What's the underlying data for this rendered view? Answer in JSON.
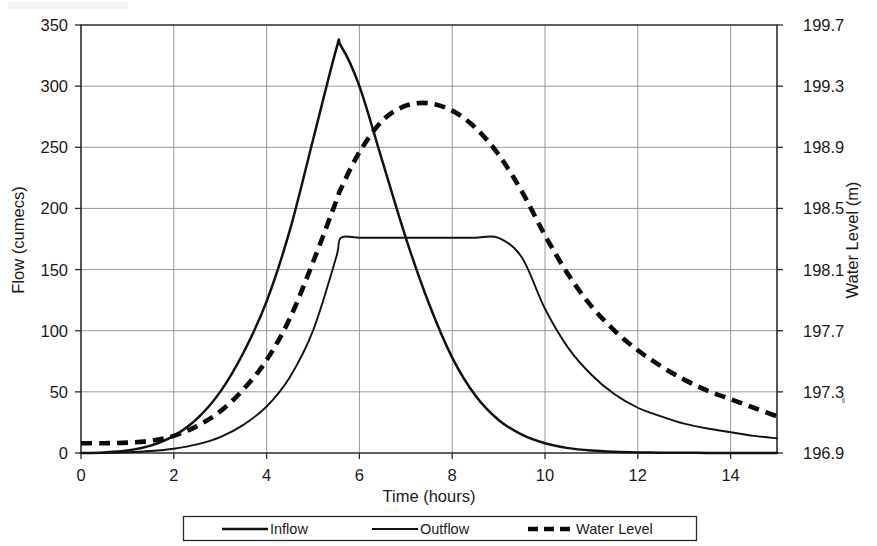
{
  "chart_data": {
    "type": "line",
    "title": "",
    "xlabel": "Time (hours)",
    "ylabel": "Flow (cumecs)",
    "y2label": "Water Level (m)",
    "xlim": [
      0,
      15
    ],
    "ylim": [
      0,
      350
    ],
    "y2lim": [
      196.9,
      199.7
    ],
    "grid": true,
    "legend_position": "bottom",
    "x_ticks": [
      0,
      2,
      4,
      6,
      8,
      10,
      12,
      14
    ],
    "x_tick_labels": [
      "0",
      "2",
      "4",
      "6",
      "8",
      "10",
      "12",
      "14"
    ],
    "y_ticks": [
      0,
      50,
      100,
      150,
      200,
      250,
      300,
      350
    ],
    "y_tick_labels": [
      "0",
      "50",
      "100",
      "150",
      "200",
      "250",
      "300",
      "350"
    ],
    "y2_ticks": [
      196.9,
      197.3,
      197.7,
      198.1,
      198.5,
      198.9,
      199.3,
      199.7
    ],
    "y2_tick_labels": [
      "196.9",
      "197.3",
      "197.7",
      "198.1",
      "198.5",
      "198.9",
      "199.3",
      "199.7"
    ],
    "x": [
      0,
      0.5,
      1,
      1.5,
      2,
      2.5,
      3,
      3.5,
      4,
      4.5,
      5,
      5.5,
      5.6,
      6,
      6.5,
      7,
      7.5,
      8,
      8.5,
      9,
      9.5,
      10,
      10.5,
      11,
      11.5,
      12,
      12.5,
      13,
      13.5,
      14,
      14.5,
      15
    ],
    "series": [
      {
        "name": "Inflow",
        "axis": "left",
        "style": "solid",
        "values": [
          0,
          0.5,
          2,
          6,
          14,
          28,
          50,
          82,
          124,
          182,
          256,
          330,
          333,
          300,
          238,
          176,
          122,
          78,
          47,
          27,
          15,
          8,
          4,
          2,
          1,
          0.5,
          0.3,
          0.2,
          0.1,
          0.1,
          0,
          0
        ]
      },
      {
        "name": "Outflow",
        "axis": "left",
        "style": "solid",
        "values": [
          0,
          0.2,
          0.6,
          1.6,
          3.5,
          7,
          13,
          23,
          38,
          62,
          100,
          160,
          176,
          176,
          176,
          176,
          176,
          176,
          176,
          176,
          160,
          118,
          86,
          64,
          48,
          37,
          30,
          24,
          20,
          17,
          14,
          12
        ]
      },
      {
        "name": "Water Level",
        "axis": "right",
        "style": "dashed",
        "values_left_equivalent": [
          8,
          8,
          8.5,
          10,
          14,
          22,
          34,
          52,
          76,
          110,
          156,
          206,
          216,
          246,
          272,
          284,
          286,
          280,
          266,
          244,
          214,
          178,
          146,
          120,
          100,
          84,
          71,
          60,
          51,
          44,
          37,
          30
        ],
        "values": [
          196.964,
          196.964,
          196.968,
          196.98,
          197.012,
          197.076,
          197.172,
          197.316,
          197.508,
          197.78,
          198.148,
          198.548,
          198.628,
          198.868,
          199.076,
          199.172,
          199.188,
          199.14,
          199.028,
          198.852,
          198.612,
          198.324,
          198.068,
          197.86,
          197.7,
          197.572,
          197.468,
          197.38,
          197.308,
          197.252,
          197.196,
          197.14
        ]
      }
    ],
    "annotations": {
      "inflow_peak": {
        "x": 5.6,
        "y": 333
      },
      "outflow_plateau": {
        "value": 176,
        "from_x": 5.6,
        "to_x": 9.3
      },
      "water_level_peak": {
        "x": 7.4,
        "y_m": 199.19
      }
    }
  },
  "legend": {
    "items": [
      {
        "label": "Inflow",
        "style": "solid-thick"
      },
      {
        "label": "Outflow",
        "style": "solid-thin"
      },
      {
        "label": "Water Level",
        "style": "dashed"
      }
    ]
  },
  "colors": {
    "line": "#121212",
    "grid": "#8d8d8d",
    "axis": "#2b2b2b",
    "background": "#ffffff"
  }
}
